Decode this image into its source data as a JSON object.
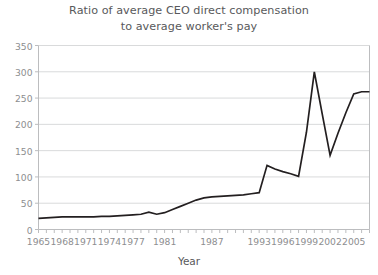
{
  "chart_data": {
    "type": "line",
    "title": "Ratio of average CEO direct compensation to average worker's pay",
    "title_line1": "Ratio of average CEO direct compensation",
    "title_line2": "to average worker's pay",
    "xlabel": "Year",
    "ylabel": "",
    "xlim": [
      1965,
      2007
    ],
    "ylim": [
      0,
      350
    ],
    "yticks": [
      0,
      50,
      100,
      150,
      200,
      250,
      300,
      350
    ],
    "ytick_labels": [
      "0",
      "50",
      "100",
      "150",
      "200",
      "250",
      "300",
      "350"
    ],
    "xtick_labels": [
      "1965",
      "1968",
      "1971",
      "1974",
      "1977",
      "1981",
      "1987",
      "1993",
      "1996",
      "1999",
      "2002",
      "2005"
    ],
    "xtick_values": [
      1965,
      1968,
      1971,
      1974,
      1977,
      1981,
      1987,
      1993,
      1996,
      1999,
      2002,
      2005
    ],
    "grid": "horizontal",
    "legend": "none",
    "line_color": "#231f20",
    "grid_color": "#d9dadb",
    "axis_color": "#bcbdbf",
    "text_color": "#58595b",
    "tick_text_color": "#8d8e90",
    "x": [
      1965,
      1966,
      1967,
      1968,
      1969,
      1970,
      1971,
      1972,
      1973,
      1974,
      1975,
      1976,
      1977,
      1978,
      1979,
      1980,
      1981,
      1982,
      1983,
      1984,
      1985,
      1986,
      1987,
      1988,
      1989,
      1990,
      1991,
      1992,
      1993,
      1994,
      1995,
      1996,
      1997,
      1998,
      1999,
      2000,
      2001,
      2002,
      2003,
      2004,
      2005,
      2006,
      2007
    ],
    "y": [
      21,
      22,
      23,
      24,
      24,
      24,
      24,
      24,
      25,
      25,
      26,
      27,
      28,
      29,
      33,
      29,
      32,
      38,
      44,
      50,
      56,
      60,
      62,
      63,
      64,
      65,
      66,
      68,
      70,
      122,
      115,
      110,
      106,
      101,
      185,
      300,
      220,
      141,
      183,
      222,
      258,
      262,
      262
    ]
  }
}
